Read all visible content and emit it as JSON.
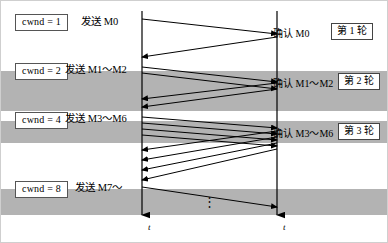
{
  "figure": {
    "type": "sequence-diagram",
    "topic": "TCP slow-start congestion window doubling each transmission round",
    "background_color": "#ffffff",
    "band_color": "#b3b3b3",
    "line_color": "#000000"
  },
  "cwnd_boxes": [
    {
      "label": "cwnd = 1",
      "value": 1,
      "x": 14,
      "y": 13
    },
    {
      "label": "cwnd = 2",
      "value": 2,
      "x": 14,
      "y": 62
    },
    {
      "label": "cwnd = 4",
      "value": 4,
      "x": 14,
      "y": 111
    },
    {
      "label": "cwnd = 8",
      "value": 8,
      "x": 14,
      "y": 180
    }
  ],
  "send_labels": [
    {
      "text": "发送 M0",
      "x": 80,
      "y": 16
    },
    {
      "text": "发送 M1～M2",
      "x": 64,
      "y": 64
    },
    {
      "text": "发送 M3～M6",
      "x": 64,
      "y": 113
    },
    {
      "text": "发送 M7～",
      "x": 74,
      "y": 182
    }
  ],
  "ack_labels": [
    {
      "text": "确认 M0",
      "x": 272,
      "y": 28
    },
    {
      "text": "确认 M1～M2",
      "x": 272,
      "y": 78
    },
    {
      "text": "确认 M3～M6",
      "x": 272,
      "y": 128
    }
  ],
  "round_boxes": [
    {
      "label": "第 1 轮",
      "round": 1,
      "x": 330,
      "y": 22
    },
    {
      "label": "第 2 轮",
      "round": 2,
      "x": 337,
      "y": 72
    },
    {
      "label": "第 3 轮",
      "round": 3,
      "x": 337,
      "y": 122
    }
  ],
  "axes": [
    {
      "name": "sender-time-axis",
      "label": "t",
      "x": 141,
      "label_x": 147,
      "label_y": 222
    },
    {
      "name": "receiver-time-axis",
      "label": "t",
      "x": 276,
      "label_x": 282,
      "label_y": 222
    }
  ],
  "ellipsis": {
    "glyph": "⋮",
    "x": 202,
    "y": 196
  },
  "bands": [
    {
      "name": "round-2-band",
      "y": 70,
      "height": 40
    },
    {
      "name": "round-3-band",
      "y": 120,
      "height": 22
    },
    {
      "name": "round-4-band",
      "y": 188,
      "height": 26
    }
  ],
  "messages": [
    {
      "name": "data-M0",
      "dir": "down-right",
      "x1": 141,
      "y1": 18,
      "x2": 276,
      "y2": 33
    },
    {
      "name": "ack-M0",
      "dir": "down-left",
      "x1": 276,
      "y1": 36,
      "x2": 141,
      "y2": 56
    },
    {
      "name": "data-M1",
      "dir": "down-right",
      "x1": 141,
      "y1": 66,
      "x2": 276,
      "y2": 81
    },
    {
      "name": "data-M2",
      "dir": "down-right",
      "x1": 141,
      "y1": 72,
      "x2": 276,
      "y2": 88
    },
    {
      "name": "ack-M1",
      "dir": "down-left",
      "x1": 276,
      "y1": 82,
      "x2": 141,
      "y2": 98
    },
    {
      "name": "ack-M2",
      "dir": "down-left",
      "x1": 276,
      "y1": 88,
      "x2": 141,
      "y2": 106
    },
    {
      "name": "data-M3",
      "dir": "down-right",
      "x1": 141,
      "y1": 116,
      "x2": 276,
      "y2": 127
    },
    {
      "name": "data-M4",
      "dir": "down-right",
      "x1": 141,
      "y1": 122,
      "x2": 276,
      "y2": 133
    },
    {
      "name": "data-M5",
      "dir": "down-right",
      "x1": 141,
      "y1": 128,
      "x2": 276,
      "y2": 139
    },
    {
      "name": "data-M6",
      "dir": "down-right",
      "x1": 141,
      "y1": 134,
      "x2": 276,
      "y2": 145
    },
    {
      "name": "ack-M3",
      "dir": "down-left",
      "x1": 276,
      "y1": 130,
      "x2": 141,
      "y2": 149
    },
    {
      "name": "ack-M4",
      "dir": "down-left",
      "x1": 276,
      "y1": 136,
      "x2": 141,
      "y2": 159
    },
    {
      "name": "ack-M5",
      "dir": "down-left",
      "x1": 276,
      "y1": 142,
      "x2": 141,
      "y2": 169
    },
    {
      "name": "ack-M6",
      "dir": "down-left",
      "x1": 276,
      "y1": 148,
      "x2": 141,
      "y2": 179
    },
    {
      "name": "data-M7",
      "dir": "down-right",
      "x1": 141,
      "y1": 186,
      "x2": 276,
      "y2": 206
    }
  ]
}
